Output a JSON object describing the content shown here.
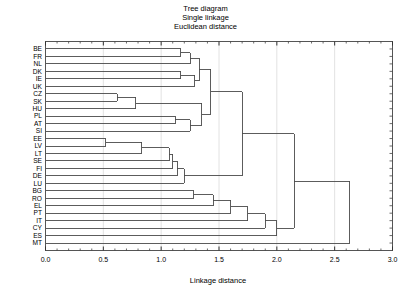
{
  "title": {
    "line1": "Tree diagram",
    "line2": "Single linkage",
    "line3": "Euclidean distance"
  },
  "axis": {
    "x_title": "Linkage distance",
    "x_ticks": [
      "0.0",
      "0.5",
      "1.0",
      "1.5",
      "2.0",
      "2.5",
      "3.0"
    ]
  },
  "chart_data": {
    "type": "dendrogram",
    "xlabel": "Linkage distance",
    "ylabel": "",
    "xlim": [
      0.0,
      3.0
    ],
    "grid": true,
    "legend": "none",
    "orientation": "horizontal",
    "linkage_method": "single",
    "distance_metric": "euclidean",
    "leaf_order": [
      "BE",
      "FR",
      "NL",
      "DK",
      "IE",
      "UK",
      "CZ",
      "SK",
      "HU",
      "PL",
      "AT",
      "SI",
      "EE",
      "LV",
      "LT",
      "SE",
      "FI",
      "DE",
      "LU",
      "BG",
      "RO",
      "EL",
      "PT",
      "IT",
      "CY",
      "ES",
      "MT"
    ],
    "leaves": [
      {
        "label": "BE",
        "position": 0
      },
      {
        "label": "FR",
        "position": 1
      },
      {
        "label": "NL",
        "position": 2
      },
      {
        "label": "DK",
        "position": 3
      },
      {
        "label": "IE",
        "position": 4
      },
      {
        "label": "UK",
        "position": 5
      },
      {
        "label": "CZ",
        "position": 6
      },
      {
        "label": "SK",
        "position": 7
      },
      {
        "label": "HU",
        "position": 8
      },
      {
        "label": "PL",
        "position": 9
      },
      {
        "label": "AT",
        "position": 10
      },
      {
        "label": "SI",
        "position": 11
      },
      {
        "label": "EE",
        "position": 12
      },
      {
        "label": "LV",
        "position": 13
      },
      {
        "label": "LT",
        "position": 14
      },
      {
        "label": "SE",
        "position": 15
      },
      {
        "label": "FI",
        "position": 16
      },
      {
        "label": "DE",
        "position": 17
      },
      {
        "label": "LU",
        "position": 18
      },
      {
        "label": "BG",
        "position": 19
      },
      {
        "label": "RO",
        "position": 20
      },
      {
        "label": "EL",
        "position": 21
      },
      {
        "label": "PT",
        "position": 22
      },
      {
        "label": "IT",
        "position": 23
      },
      {
        "label": "CY",
        "position": 24
      },
      {
        "label": "ES",
        "position": 25
      },
      {
        "label": "MT",
        "position": 26
      }
    ],
    "merges": [
      {
        "id": "m1",
        "left": "BE",
        "right": "FR",
        "distance": 1.17
      },
      {
        "id": "m2",
        "left": "DK",
        "right": "IE",
        "distance": 1.17
      },
      {
        "id": "m3",
        "left": "m2",
        "right": "UK",
        "distance": 1.29
      },
      {
        "id": "m4",
        "left": "m1",
        "right": "NL",
        "distance": 1.25
      },
      {
        "id": "m5",
        "left": "m4",
        "right": "m3",
        "distance": 1.33
      },
      {
        "id": "m6",
        "left": "CZ",
        "right": "SK",
        "distance": 0.62
      },
      {
        "id": "m7",
        "left": "m6",
        "right": "HU",
        "distance": 0.78
      },
      {
        "id": "m8",
        "left": "PL",
        "right": "AT",
        "distance": 1.12
      },
      {
        "id": "m9",
        "left": "m8",
        "right": "SI",
        "distance": 1.25
      },
      {
        "id": "m10",
        "left": "m7",
        "right": "m9",
        "distance": 1.35
      },
      {
        "id": "m11",
        "left": "m5",
        "right": "m10",
        "distance": 1.43
      },
      {
        "id": "m12",
        "left": "EE",
        "right": "LV",
        "distance": 0.52
      },
      {
        "id": "m13",
        "left": "m12",
        "right": "LT",
        "distance": 0.83
      },
      {
        "id": "m14",
        "left": "m13",
        "right": "SE",
        "distance": 1.07
      },
      {
        "id": "m15",
        "left": "m14",
        "right": "FI",
        "distance": 1.1
      },
      {
        "id": "m16",
        "left": "m15",
        "right": "DE",
        "distance": 1.14
      },
      {
        "id": "m17",
        "left": "m16",
        "right": "LU",
        "distance": 1.2
      },
      {
        "id": "m18",
        "left": "m11",
        "right": "m17",
        "distance": 1.7
      },
      {
        "id": "m19",
        "left": "BG",
        "right": "RO",
        "distance": 1.28
      },
      {
        "id": "m20",
        "left": "m19",
        "right": "EL",
        "distance": 1.45
      },
      {
        "id": "m21",
        "left": "m20",
        "right": "PT",
        "distance": 1.6
      },
      {
        "id": "m22",
        "left": "m21",
        "right": "IT",
        "distance": 1.75
      },
      {
        "id": "m23",
        "left": "m22",
        "right": "CY",
        "distance": 1.9
      },
      {
        "id": "m24",
        "left": "m23",
        "right": "ES",
        "distance": 2.0
      },
      {
        "id": "m25",
        "left": "m18",
        "right": "m24",
        "distance": 2.15
      },
      {
        "id": "m26",
        "left": "m25",
        "right": "MT",
        "distance": 2.63
      }
    ]
  },
  "style": {
    "line_color": "#4a4a4a",
    "frame_color": "#555555",
    "grid_color": "#e2e2e2",
    "background": "#ffffff"
  }
}
